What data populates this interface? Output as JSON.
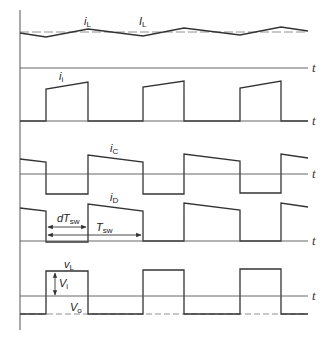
{
  "diagram": {
    "type": "waveform-timing-diagram",
    "time_axis_label": "t",
    "panels": [
      {
        "id": "inductor-current",
        "labels": [
          {
            "main": "i",
            "sub": "L"
          },
          {
            "main": "I",
            "sub": "L"
          }
        ]
      },
      {
        "id": "input-current",
        "labels": [
          {
            "main": "i",
            "sub": "i"
          }
        ]
      },
      {
        "id": "capacitor-current",
        "labels": [
          {
            "main": "i",
            "sub": "C"
          }
        ]
      },
      {
        "id": "diode-current",
        "labels": [
          {
            "main": "i",
            "sub": "D"
          }
        ],
        "annotations": [
          {
            "main": "dT",
            "sub": "sw"
          },
          {
            "main": "T",
            "sub": "sw"
          }
        ]
      },
      {
        "id": "inductor-voltage",
        "labels": [
          {
            "main": "v",
            "sub": "L"
          },
          {
            "main": "V",
            "sub": "i"
          },
          {
            "main": "V",
            "sub": "o"
          }
        ]
      }
    ],
    "colors": {
      "line": "#333333",
      "axis": "#555555",
      "background": "#ffffff"
    }
  },
  "labels": {
    "iL_main": "i",
    "iL_sub": "L",
    "IL_main": "I",
    "IL_sub": "L",
    "ii_main": "i",
    "ii_sub": "i",
    "iC_main": "i",
    "iC_sub": "C",
    "iD_main": "i",
    "iD_sub": "D",
    "dTsw_main": "dT",
    "dTsw_sub": "sw",
    "Tsw_main": "T",
    "Tsw_sub": "sw",
    "vL_main": "v",
    "vL_sub": "L",
    "Vi_main": "V",
    "Vi_sub": "i",
    "Vo_main": "V",
    "Vo_sub": "o",
    "t": "t"
  }
}
